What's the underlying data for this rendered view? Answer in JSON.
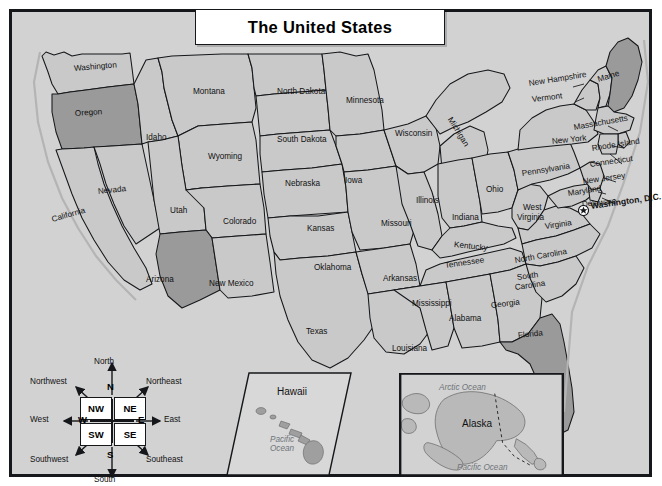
{
  "title": "The United States",
  "colors": {
    "background": "#ffffff",
    "map_fill": "#d2d2d2",
    "land_fill": "#c9c9c9",
    "highlight_fill": "#9a9a9a",
    "border": "#15171a",
    "ocean_text": "#6f7479"
  },
  "highlighted_states": [
    "Oregon",
    "Arizona",
    "Florida",
    "Maine"
  ],
  "capital": {
    "name": "Washington, D.C.",
    "marker": "star-in-circle"
  },
  "states": [
    {
      "name": "Washington",
      "x": 62,
      "y": 53,
      "rot": -5
    },
    {
      "name": "Oregon",
      "x": 63,
      "y": 98,
      "rot": -4
    },
    {
      "name": "California",
      "x": 40,
      "y": 204,
      "rot": -16
    },
    {
      "name": "Nevada",
      "x": 86,
      "y": 176,
      "rot": -6
    },
    {
      "name": "Idaho",
      "x": 134,
      "y": 122,
      "rot": 0
    },
    {
      "name": "Montana",
      "x": 181,
      "y": 76,
      "rot": 0
    },
    {
      "name": "Wyoming",
      "x": 196,
      "y": 141,
      "rot": 0
    },
    {
      "name": "Utah",
      "x": 158,
      "y": 195,
      "rot": 0
    },
    {
      "name": "Colorado",
      "x": 211,
      "y": 206,
      "rot": 0
    },
    {
      "name": "Arizona",
      "x": 134,
      "y": 264,
      "rot": 0
    },
    {
      "name": "New Mexico",
      "x": 197,
      "y": 268,
      "rot": 0
    },
    {
      "name": "North Dakota",
      "x": 265,
      "y": 76,
      "rot": 0
    },
    {
      "name": "South Dakota",
      "x": 265,
      "y": 124,
      "rot": 0
    },
    {
      "name": "Nebraska",
      "x": 273,
      "y": 168,
      "rot": 0
    },
    {
      "name": "Kansas",
      "x": 295,
      "y": 213,
      "rot": 0
    },
    {
      "name": "Oklahoma",
      "x": 302,
      "y": 252,
      "rot": 0
    },
    {
      "name": "Texas",
      "x": 294,
      "y": 316,
      "rot": 0
    },
    {
      "name": "Minnesota",
      "x": 334,
      "y": 85,
      "rot": 0
    },
    {
      "name": "Iowa",
      "x": 333,
      "y": 165,
      "rot": 0
    },
    {
      "name": "Missouri",
      "x": 369,
      "y": 208,
      "rot": 0
    },
    {
      "name": "Arkansas",
      "x": 371,
      "y": 263,
      "rot": 0
    },
    {
      "name": "Louisiana",
      "x": 380,
      "y": 333,
      "rot": 0
    },
    {
      "name": "Wisconsin",
      "x": 383,
      "y": 118,
      "rot": 0
    },
    {
      "name": "Illinois",
      "x": 404,
      "y": 185,
      "rot": 0
    },
    {
      "name": "Michigan",
      "x": 437,
      "y": 102,
      "rot": 58
    },
    {
      "name": "Indiana",
      "x": 440,
      "y": 202,
      "rot": 0
    },
    {
      "name": "Kentucky",
      "x": 442,
      "y": 229,
      "rot": 6
    },
    {
      "name": "Tennessee",
      "x": 433,
      "y": 250,
      "rot": -8
    },
    {
      "name": "Mississippi",
      "x": 400,
      "y": 288,
      "rot": 0
    },
    {
      "name": "Alabama",
      "x": 437,
      "y": 303,
      "rot": 0
    },
    {
      "name": "Georgia",
      "x": 479,
      "y": 290,
      "rot": -7
    },
    {
      "name": "Ohio",
      "x": 474,
      "y": 174,
      "rot": 0
    },
    {
      "name": "West",
      "x": 511,
      "y": 192,
      "rot": 0
    },
    {
      "name": "Virginia",
      "x": 505,
      "y": 202,
      "rot": 0
    },
    {
      "name": "Virginia",
      "x": 533,
      "y": 211,
      "rot": -8
    },
    {
      "name": "North Carolina",
      "x": 503,
      "y": 245,
      "rot": -10
    },
    {
      "name": "South",
      "x": 505,
      "y": 262,
      "rot": -8
    },
    {
      "name": "Carolina",
      "x": 503,
      "y": 272,
      "rot": -8
    },
    {
      "name": "Florida",
      "x": 506,
      "y": 320,
      "rot": -6
    },
    {
      "name": "Pennsylvania",
      "x": 510,
      "y": 158,
      "rot": -9
    },
    {
      "name": "New York",
      "x": 540,
      "y": 126,
      "rot": -6
    },
    {
      "name": "Maryland",
      "x": 556,
      "y": 178,
      "rot": -9
    },
    {
      "name": "Delaware",
      "x": 570,
      "y": 189,
      "rot": -6
    },
    {
      "name": "New Jersey",
      "x": 571,
      "y": 166,
      "rot": -8
    },
    {
      "name": "New Hampshire",
      "x": 517,
      "y": 68,
      "rot": -9
    },
    {
      "name": "Vermont",
      "x": 520,
      "y": 84,
      "rot": -7
    },
    {
      "name": "Maine",
      "x": 586,
      "y": 64,
      "rot": -17
    },
    {
      "name": "Massachusetts",
      "x": 562,
      "y": 112,
      "rot": -10
    },
    {
      "name": "Rhode Island",
      "x": 580,
      "y": 133,
      "rot": -9
    },
    {
      "name": "Connecticut",
      "x": 578,
      "y": 149,
      "rot": -8
    }
  ],
  "insets": {
    "hawaii": {
      "label": "Hawaii",
      "ocean": "Pacific Ocean"
    },
    "alaska": {
      "label": "Alaska",
      "ocean_top": "Arctic Ocean",
      "ocean_bottom": "Pacific Ocean"
    }
  },
  "compass": {
    "boxes": [
      {
        "key": "NW",
        "label": "NW"
      },
      {
        "key": "NE",
        "label": "NE"
      },
      {
        "key": "SW",
        "label": "SW"
      },
      {
        "key": "SE",
        "label": "SE"
      }
    ],
    "cardinals": [
      {
        "key": "N",
        "label": "N"
      },
      {
        "key": "S",
        "label": "S"
      },
      {
        "key": "E",
        "label": "E"
      },
      {
        "key": "W",
        "label": "W"
      }
    ],
    "names": [
      {
        "key": "north",
        "label": "North"
      },
      {
        "key": "south",
        "label": "South"
      },
      {
        "key": "east",
        "label": "East"
      },
      {
        "key": "west",
        "label": "West"
      },
      {
        "key": "northwest",
        "label": "Northwest"
      },
      {
        "key": "northeast",
        "label": "Northeast"
      },
      {
        "key": "southwest",
        "label": "Southwest"
      },
      {
        "key": "southeast",
        "label": "Southeast"
      }
    ]
  }
}
